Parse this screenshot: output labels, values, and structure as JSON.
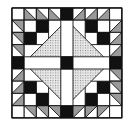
{
  "image": {
    "title": "Quilt block",
    "description": "9x9 patchwork quilt block with dotted central diamond, white cross bars, black center and corner squares, and gray half-square-triangle border",
    "grid": {
      "rows": 9,
      "cols": 9,
      "origin_x": 12,
      "origin_y": 8,
      "cell": 12.2
    },
    "colors": {
      "black": "#111111",
      "white": "#ffffff",
      "gray": "#9a9a9a",
      "dotted_bg": "#e6e6e6",
      "dot": "#8a8a8a",
      "line": "#111111"
    },
    "border_cells": {
      "corners": "white",
      "edge_midpoints": "black",
      "top": [
        "white",
        "hst-bl",
        "hst-bl",
        "hst-bl",
        "black",
        "hst-br",
        "hst-br",
        "hst-br",
        "white"
      ]
    },
    "inner_corners": {
      "top_left": [
        [
          "white",
          "black"
        ],
        [
          "black",
          "white"
        ]
      ],
      "top_right": [
        [
          "black",
          "white"
        ],
        [
          "white",
          "black"
        ]
      ],
      "bottom_left": [
        [
          "black",
          "white"
        ],
        [
          "white",
          "black"
        ]
      ],
      "bottom_right": [
        [
          "white",
          "black"
        ],
        [
          "black",
          "white"
        ]
      ]
    },
    "center": "black"
  }
}
